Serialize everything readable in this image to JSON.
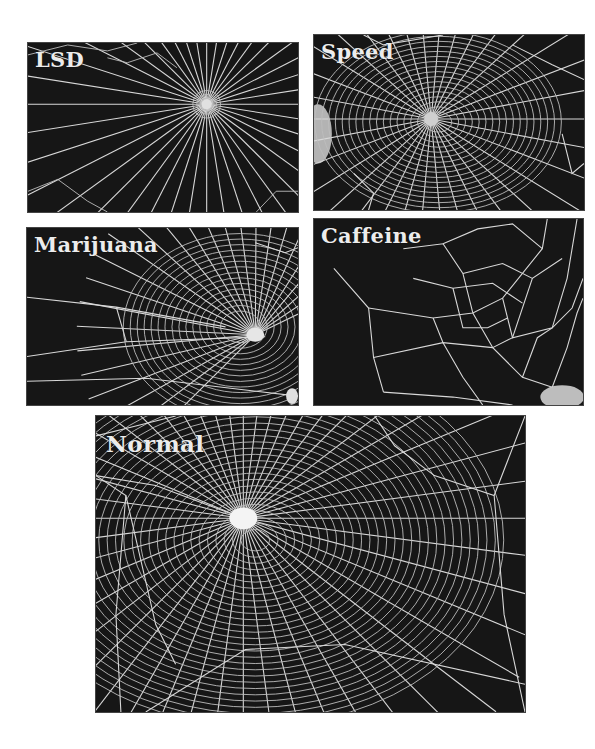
{
  "figure": {
    "panels": [
      {
        "id": "lsd",
        "label": "LSD"
      },
      {
        "id": "speed",
        "label": "Speed"
      },
      {
        "id": "marijuana",
        "label": "Marijuana"
      },
      {
        "id": "caffeine",
        "label": "Caffeine"
      },
      {
        "id": "normal",
        "label": "Normal"
      }
    ],
    "colors": {
      "background": "#161616",
      "thread": "#d8d8d8",
      "label": "#ececec",
      "page": "#ffffff"
    }
  }
}
